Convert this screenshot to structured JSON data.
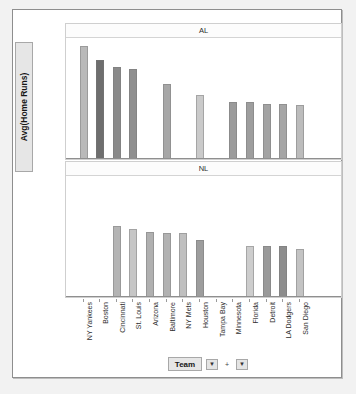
{
  "axis": {
    "y_title": "Avg(Home Runs)",
    "x_title": "Team",
    "y_menu_caret": "▶",
    "y_plus": "+",
    "y_caret2": "▶",
    "x_caret": "▼",
    "x_plus": "+",
    "x_caret2": "▼"
  },
  "chart_data": {
    "type": "bar",
    "title": "",
    "xlabel": "Team",
    "ylabel": "Avg(Home Runs)",
    "ylim": [
      0,
      28
    ],
    "yticks": [
      0,
      5,
      10,
      15,
      20,
      25
    ],
    "grid": false,
    "legend": "none",
    "panels": [
      {
        "label": "AL",
        "categories": [
          "NY Yankees",
          "Boston",
          "Cincinnati",
          "St. Louis",
          "Arizona",
          "Baltimore",
          "NY Mets",
          "Houston",
          "Tampa Bay",
          "Minnesota",
          "Florida",
          "Detroit",
          "LA Dodgers",
          "San Diego"
        ],
        "values": [
          26.0,
          22.8,
          21.2,
          20.6,
          null,
          17.3,
          null,
          14.7,
          null,
          13.2,
          13.1,
          12.7,
          12.6,
          12.3
        ],
        "colors": [
          "#b9b9b9",
          "#6e6e6e",
          "#8a8a8a",
          "#8f8f8f",
          null,
          "#a7a7a7",
          null,
          "#cacaca",
          null,
          "#9b9b9b",
          "#9e9e9e",
          "#a3a3a3",
          "#a5a5a5",
          "#bcbcbc"
        ]
      },
      {
        "label": "NL",
        "categories": [
          "NY Yankees",
          "Boston",
          "Cincinnati",
          "St. Louis",
          "Arizona",
          "Baltimore",
          "NY Mets",
          "Houston",
          "Tampa Bay",
          "Minnesota",
          "Florida",
          "Detroit",
          "LA Dodgers",
          "San Diego"
        ],
        "values": [
          null,
          null,
          16.3,
          15.5,
          14.9,
          14.7,
          14.6,
          13.2,
          null,
          null,
          11.7,
          11.6,
          11.6,
          11.0
        ],
        "colors": [
          null,
          null,
          "#b4b4b4",
          "#c6c6c6",
          "#b0b0b0",
          "#b2b2b2",
          "#bfbfbf",
          "#9d9d9d",
          null,
          null,
          "#cdcdcd",
          "#9a9a9a",
          "#8d8d8d",
          "#c3c3c3"
        ]
      }
    ],
    "bar_x_positions": [
      14,
      30,
      47,
      63,
      80,
      97,
      113,
      130,
      147,
      163,
      180,
      197,
      213,
      230
    ]
  }
}
